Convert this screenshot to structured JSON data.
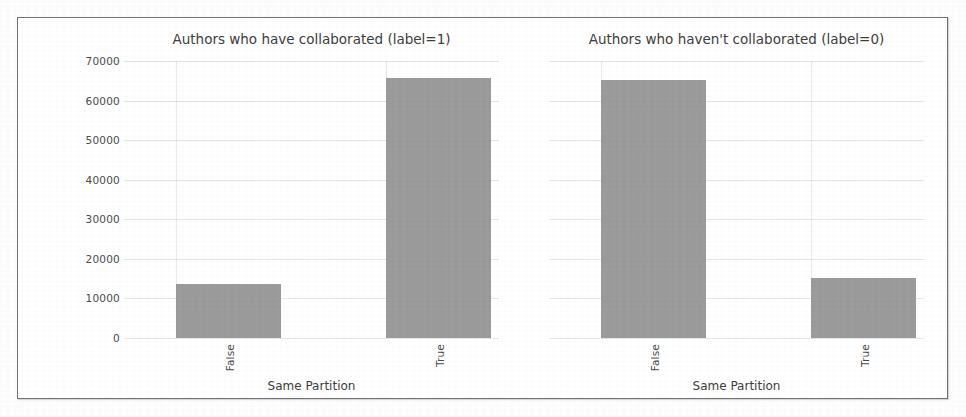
{
  "chart_data": {
    "type": "bar",
    "panels": [
      {
        "title": "Authors who have collaborated (label=1)",
        "xlabel": "Same Partition",
        "ylabel": "",
        "categories": [
          "False",
          "True"
        ],
        "values": [
          14000,
          67500
        ],
        "ylim": [
          0,
          72000
        ]
      },
      {
        "title": "Authors who haven't collaborated (label=0)",
        "xlabel": "Same Partition",
        "ylabel": "",
        "categories": [
          "False",
          "True"
        ],
        "values": [
          67000,
          15700
        ],
        "ylim": [
          0,
          72000
        ]
      }
    ],
    "yticks": [
      "0",
      "10000",
      "20000",
      "30000",
      "40000",
      "50000",
      "60000",
      "70000"
    ],
    "ytick_values": [
      0,
      10000,
      20000,
      30000,
      40000,
      50000,
      60000,
      70000
    ],
    "ylim": [
      0,
      72000
    ],
    "grid": true,
    "legend": "none",
    "bar_color": "#9b9b9b",
    "background_color": "#ffffff"
  },
  "figure": {
    "panel_left": {
      "title": "Authors who have collaborated (label=1)",
      "xlabel": "Same Partition",
      "tick_false": "False",
      "tick_true": "True"
    },
    "panel_right": {
      "title": "Authors who haven't collaborated (label=0)",
      "xlabel": "Same Partition",
      "tick_false": "False",
      "tick_true": "True"
    },
    "yticks": {
      "t0": "0",
      "t1": "10000",
      "t2": "20000",
      "t3": "30000",
      "t4": "40000",
      "t5": "50000",
      "t6": "60000",
      "t7": "70000"
    }
  }
}
